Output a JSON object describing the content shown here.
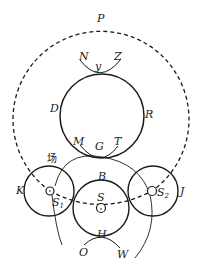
{
  "diagram": {
    "labels": {
      "P": "P",
      "N": "N",
      "y": "y",
      "Z": "Z",
      "D": "D",
      "R": "R",
      "M": "M",
      "G": "G",
      "T": "T",
      "chang": "场",
      "B": "B",
      "K": "K",
      "S1": "S",
      "S1_sub": "1",
      "S": "S",
      "S2": "S",
      "S2_sub": "2",
      "J": "J",
      "H": "H",
      "O": "O",
      "W": "W"
    },
    "colors": {
      "stroke": "#1a1a1a",
      "background": "#ffffff"
    }
  }
}
